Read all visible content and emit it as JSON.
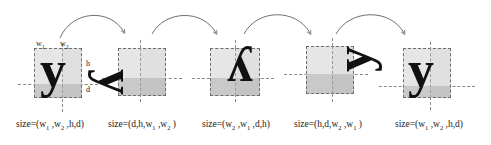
{
  "figure": {
    "type": "glyph-rotation-diagram",
    "glyph_character": "y",
    "colors": {
      "glyph": "#111111",
      "box_border": "#6e6e6e",
      "reference_line": "#8a8a8a",
      "shade_upper": "#e6e6e6",
      "shade_lower": "#c9c9c9",
      "arrow": "#555555",
      "background": "#ffffff"
    },
    "dimension_labels": {
      "w1": "w",
      "w1_sub": "1",
      "w2": "w",
      "w2_sub": "2",
      "h": "h",
      "d": "d"
    },
    "arrows": [
      {
        "from": "stage-1",
        "to": "stage-2",
        "label": "rotate 90"
      },
      {
        "from": "stage-2",
        "to": "stage-3",
        "label": "rotate 90"
      },
      {
        "from": "stage-3",
        "to": "stage-4",
        "label": "rotate 90"
      },
      {
        "from": "stage-4",
        "to": "stage-5",
        "label": "rotate 90"
      }
    ],
    "stages": [
      {
        "id": "stage-1",
        "rotation_deg": 0,
        "caption_prefix": "size=(",
        "caption_suffix": ")",
        "size_tuple": [
          "w₁",
          "w₂",
          "h",
          "d"
        ],
        "caption": "size=(w₁ ,w₂ ,h,d)",
        "caption_parts": [
          {
            "text": "size=(w",
            "sub": ""
          },
          {
            "text": "",
            "sub": "1"
          },
          {
            "text": " ,w",
            "sub": ""
          },
          {
            "text": "",
            "sub": "2"
          },
          {
            "text": " ,h,d)",
            "sub": ""
          }
        ]
      },
      {
        "id": "stage-2",
        "rotation_deg": 90,
        "caption_prefix": "size=(",
        "caption_suffix": ")",
        "size_tuple": [
          "d",
          "h",
          "w₁",
          "w₂"
        ],
        "caption": "size=(d,h,w₁ ,w₂ )",
        "caption_parts": [
          {
            "text": "size=(d,h,w",
            "sub": ""
          },
          {
            "text": "",
            "sub": "1"
          },
          {
            "text": " ,w",
            "sub": ""
          },
          {
            "text": "",
            "sub": "2"
          },
          {
            "text": " )",
            "sub": ""
          }
        ]
      },
      {
        "id": "stage-3",
        "rotation_deg": 180,
        "caption_prefix": "size=(",
        "caption_suffix": ")",
        "size_tuple": [
          "w₂",
          "w₁",
          "d",
          "h"
        ],
        "caption": "size=(w₂ ,w₁ ,d,h)",
        "caption_parts": [
          {
            "text": "size=(w",
            "sub": ""
          },
          {
            "text": "",
            "sub": "2"
          },
          {
            "text": " ,w",
            "sub": ""
          },
          {
            "text": "",
            "sub": "1"
          },
          {
            "text": " ,d,h)",
            "sub": ""
          }
        ]
      },
      {
        "id": "stage-4",
        "rotation_deg": 270,
        "caption_prefix": "size=(",
        "caption_suffix": ")",
        "size_tuple": [
          "h",
          "d",
          "w₂",
          "w₁"
        ],
        "caption": "size=(h,d,w₂ ,w₁ )",
        "caption_parts": [
          {
            "text": "size=(h,d,w",
            "sub": ""
          },
          {
            "text": "",
            "sub": "2"
          },
          {
            "text": " ,w",
            "sub": ""
          },
          {
            "text": "",
            "sub": "1"
          },
          {
            "text": " )",
            "sub": ""
          }
        ]
      },
      {
        "id": "stage-5",
        "rotation_deg": 360,
        "caption_prefix": "size=(",
        "caption_suffix": ")",
        "size_tuple": [
          "w₁",
          "w₂",
          "h",
          "d"
        ],
        "caption": "size=(w₁ ,w₂ ,h,d)",
        "caption_parts": [
          {
            "text": "size=(w",
            "sub": ""
          },
          {
            "text": "",
            "sub": "1"
          },
          {
            "text": " ,w",
            "sub": ""
          },
          {
            "text": "",
            "sub": "2"
          },
          {
            "text": " ,h,d)",
            "sub": ""
          }
        ]
      }
    ]
  }
}
